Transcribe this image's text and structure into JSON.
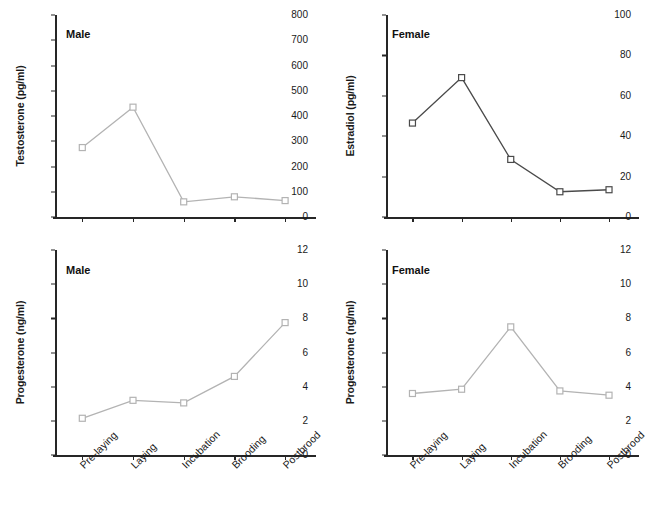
{
  "figure": {
    "categories": [
      "Pre-laying",
      "Laying",
      "Incubation",
      "Brooding",
      "Postbrood"
    ],
    "colors": {
      "light_series": "#b3b3b3",
      "dark_series": "#4a4a4a",
      "axis": "#262626",
      "text": "#1a1a1a",
      "background": "#ffffff"
    }
  },
  "chart_data": [
    {
      "id": "male-testosterone",
      "type": "line",
      "title": "Male",
      "xlabel": "",
      "ylabel": "Testosterone (pg/ml)",
      "categories": [
        "Pre-laying",
        "Laying",
        "Incubation",
        "Brooding",
        "Postbrood"
      ],
      "values": [
        275,
        435,
        60,
        80,
        65
      ],
      "ylim": [
        0,
        800
      ],
      "yticks": [
        0,
        100,
        200,
        300,
        400,
        500,
        600,
        700,
        800
      ],
      "ytick_labels": [
        "0",
        "100",
        "200",
        "300",
        "400",
        "500",
        "600",
        "700",
        "800"
      ],
      "grid": false,
      "legend": "none",
      "marker": "open-square",
      "color": "#b3b3b3"
    },
    {
      "id": "female-estradiol",
      "type": "line",
      "title": "Female",
      "xlabel": "",
      "ylabel": "Estradiol (pg/ml)",
      "categories": [
        "Pre-laying",
        "Laying",
        "Incubation",
        "Brooding",
        "Postbrood"
      ],
      "values": [
        46.5,
        69,
        28.5,
        12.5,
        13.5
      ],
      "ylim": [
        0,
        100
      ],
      "yticks": [
        0,
        20,
        40,
        60,
        80,
        100
      ],
      "ytick_labels": [
        "0",
        "20",
        "40",
        "60",
        "80",
        "100"
      ],
      "grid": false,
      "legend": "none",
      "marker": "open-square",
      "color": "#4a4a4a"
    },
    {
      "id": "male-progesterone",
      "type": "line",
      "title": "Male",
      "xlabel": "",
      "ylabel": "Progesterone (ng/ml)",
      "categories": [
        "Pre-laying",
        "Laying",
        "Incubation",
        "Brooding",
        "Postbrood"
      ],
      "values": [
        2.15,
        3.2,
        3.05,
        4.6,
        7.75
      ],
      "ylim": [
        0,
        12
      ],
      "yticks": [
        0,
        2,
        4,
        6,
        8,
        10,
        12
      ],
      "ytick_labels": [
        "0",
        "2",
        "4",
        "6",
        "8",
        "10",
        "12"
      ],
      "grid": false,
      "legend": "none",
      "marker": "open-square",
      "color": "#b3b3b3"
    },
    {
      "id": "female-progesterone",
      "type": "line",
      "title": "Female",
      "xlabel": "",
      "ylabel": "Progesterone (ng/ml)",
      "categories": [
        "Pre-laying",
        "Laying",
        "Incubation",
        "Brooding",
        "Postbrood"
      ],
      "values": [
        3.6,
        3.85,
        7.5,
        3.75,
        3.5
      ],
      "ylim": [
        0,
        12
      ],
      "yticks": [
        0,
        2,
        4,
        6,
        8,
        10,
        12
      ],
      "ytick_labels": [
        "0",
        "2",
        "4",
        "6",
        "8",
        "10",
        "12"
      ],
      "grid": false,
      "legend": "none",
      "marker": "open-square",
      "color": "#b3b3b3"
    }
  ]
}
